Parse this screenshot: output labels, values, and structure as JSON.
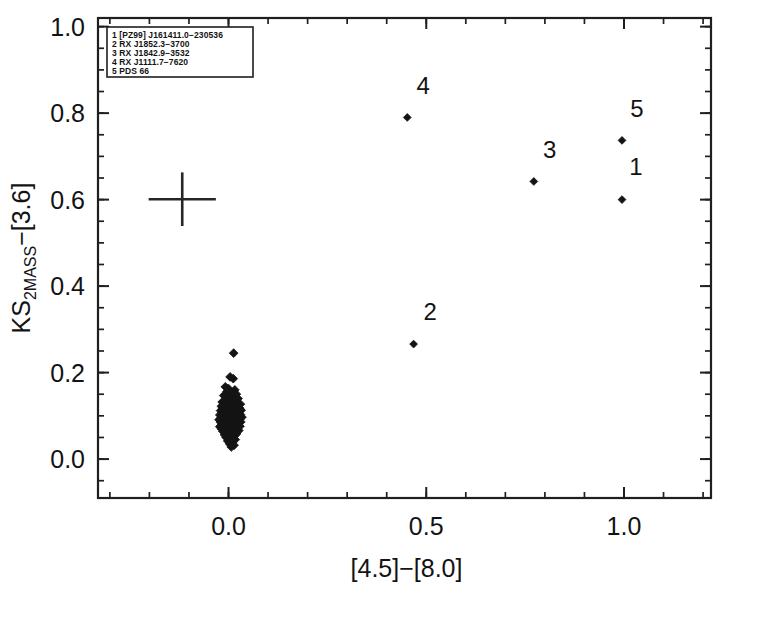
{
  "chart_data": {
    "type": "scatter",
    "title": "",
    "xlabel": "[4.5]−[8.0]",
    "ylabel": "KS_2MASS−[3.6]",
    "ylabel_main": "KS",
    "ylabel_sub": "2MASS",
    "ylabel_rest": "−[3.6]",
    "xlim": [
      -0.33,
      1.22
    ],
    "ylim": [
      -0.09,
      1.02
    ],
    "xticks": [
      0.0,
      0.5,
      1.0
    ],
    "xticklabels": [
      "0.0",
      "0.5",
      "1.0"
    ],
    "yticks": [
      0.0,
      0.2,
      0.4,
      0.6,
      0.8,
      1.0
    ],
    "yticklabels": [
      "0.0",
      "0.2",
      "0.4",
      "0.6",
      "0.8",
      "1.0"
    ],
    "minor_tick_interval_x": 0.1,
    "minor_tick_interval_y": 0.05,
    "grid": false,
    "legend_position": "top-left",
    "marker": "diamond",
    "labeled_points": [
      {
        "id": "1",
        "x": 0.995,
        "y": 0.6,
        "label_dx": 0.035,
        "label_dy": 0.075
      },
      {
        "id": "2",
        "x": 0.468,
        "y": 0.266,
        "label_dx": 0.042,
        "label_dy": 0.073
      },
      {
        "id": "3",
        "x": 0.772,
        "y": 0.642,
        "label_dx": 0.04,
        "label_dy": 0.072
      },
      {
        "id": "4",
        "x": 0.452,
        "y": 0.79,
        "label_dx": 0.04,
        "label_dy": 0.072
      },
      {
        "id": "5",
        "x": 0.995,
        "y": 0.737,
        "label_dx": 0.038,
        "label_dy": 0.072
      }
    ],
    "error_bar": {
      "x": -0.117,
      "y": 0.601,
      "xerr": 0.085,
      "yerr": 0.062
    },
    "cluster_points": [
      {
        "x": 0.013,
        "y": 0.245
      },
      {
        "x": 0.004,
        "y": 0.19
      },
      {
        "x": 0.012,
        "y": 0.186
      },
      {
        "x": -0.008,
        "y": 0.167
      },
      {
        "x": 0.0,
        "y": 0.163
      },
      {
        "x": 0.016,
        "y": 0.16
      },
      {
        "x": -0.004,
        "y": 0.156
      },
      {
        "x": 0.008,
        "y": 0.152
      },
      {
        "x": 0.02,
        "y": 0.15
      },
      {
        "x": -0.012,
        "y": 0.147
      },
      {
        "x": 0.002,
        "y": 0.144
      },
      {
        "x": 0.014,
        "y": 0.142
      },
      {
        "x": 0.024,
        "y": 0.14
      },
      {
        "x": -0.006,
        "y": 0.138
      },
      {
        "x": 0.006,
        "y": 0.136
      },
      {
        "x": 0.018,
        "y": 0.134
      },
      {
        "x": -0.016,
        "y": 0.132
      },
      {
        "x": -0.002,
        "y": 0.13
      },
      {
        "x": 0.01,
        "y": 0.129
      },
      {
        "x": 0.022,
        "y": 0.128
      },
      {
        "x": 0.03,
        "y": 0.127
      },
      {
        "x": -0.01,
        "y": 0.126
      },
      {
        "x": 0.0,
        "y": 0.125
      },
      {
        "x": 0.012,
        "y": 0.124
      },
      {
        "x": 0.024,
        "y": 0.123
      },
      {
        "x": -0.018,
        "y": 0.122
      },
      {
        "x": -0.006,
        "y": 0.121
      },
      {
        "x": 0.004,
        "y": 0.12
      },
      {
        "x": 0.016,
        "y": 0.119
      },
      {
        "x": 0.028,
        "y": 0.118
      },
      {
        "x": -0.014,
        "y": 0.117
      },
      {
        "x": -0.002,
        "y": 0.116
      },
      {
        "x": 0.008,
        "y": 0.115
      },
      {
        "x": 0.02,
        "y": 0.114
      },
      {
        "x": 0.032,
        "y": 0.113
      },
      {
        "x": -0.02,
        "y": 0.112
      },
      {
        "x": -0.008,
        "y": 0.111
      },
      {
        "x": 0.002,
        "y": 0.11
      },
      {
        "x": 0.014,
        "y": 0.109
      },
      {
        "x": 0.026,
        "y": 0.108
      },
      {
        "x": -0.016,
        "y": 0.107
      },
      {
        "x": -0.004,
        "y": 0.106
      },
      {
        "x": 0.006,
        "y": 0.105
      },
      {
        "x": 0.018,
        "y": 0.104
      },
      {
        "x": 0.03,
        "y": 0.103
      },
      {
        "x": -0.022,
        "y": 0.102
      },
      {
        "x": -0.01,
        "y": 0.101
      },
      {
        "x": 0.0,
        "y": 0.1
      },
      {
        "x": 0.01,
        "y": 0.099
      },
      {
        "x": 0.022,
        "y": 0.098
      },
      {
        "x": 0.034,
        "y": 0.097
      },
      {
        "x": -0.018,
        "y": 0.096
      },
      {
        "x": -0.006,
        "y": 0.095
      },
      {
        "x": 0.004,
        "y": 0.094
      },
      {
        "x": 0.016,
        "y": 0.093
      },
      {
        "x": 0.028,
        "y": 0.092
      },
      {
        "x": -0.024,
        "y": 0.091
      },
      {
        "x": -0.012,
        "y": 0.09
      },
      {
        "x": -0.002,
        "y": 0.089
      },
      {
        "x": 0.008,
        "y": 0.088
      },
      {
        "x": 0.02,
        "y": 0.087
      },
      {
        "x": 0.031,
        "y": 0.086
      },
      {
        "x": -0.02,
        "y": 0.085
      },
      {
        "x": -0.008,
        "y": 0.084
      },
      {
        "x": 0.002,
        "y": 0.083
      },
      {
        "x": 0.012,
        "y": 0.082
      },
      {
        "x": 0.024,
        "y": 0.081
      },
      {
        "x": -0.016,
        "y": 0.08
      },
      {
        "x": -0.004,
        "y": 0.079
      },
      {
        "x": 0.006,
        "y": 0.078
      },
      {
        "x": 0.018,
        "y": 0.077
      },
      {
        "x": 0.029,
        "y": 0.076
      },
      {
        "x": -0.022,
        "y": 0.075
      },
      {
        "x": -0.01,
        "y": 0.074
      },
      {
        "x": 0.0,
        "y": 0.073
      },
      {
        "x": 0.01,
        "y": 0.072
      },
      {
        "x": 0.021,
        "y": 0.071
      },
      {
        "x": -0.018,
        "y": 0.07
      },
      {
        "x": -0.006,
        "y": 0.069
      },
      {
        "x": 0.004,
        "y": 0.068
      },
      {
        "x": 0.015,
        "y": 0.067
      },
      {
        "x": 0.026,
        "y": 0.066
      },
      {
        "x": -0.014,
        "y": 0.064
      },
      {
        "x": -0.002,
        "y": 0.062
      },
      {
        "x": 0.009,
        "y": 0.06
      },
      {
        "x": 0.02,
        "y": 0.058
      },
      {
        "x": -0.01,
        "y": 0.056
      },
      {
        "x": 0.001,
        "y": 0.054
      },
      {
        "x": 0.013,
        "y": 0.052
      },
      {
        "x": -0.006,
        "y": 0.05
      },
      {
        "x": 0.006,
        "y": 0.047
      },
      {
        "x": 0.017,
        "y": 0.045
      },
      {
        "x": -0.002,
        "y": 0.042
      },
      {
        "x": 0.01,
        "y": 0.039
      },
      {
        "x": 0.003,
        "y": 0.035
      },
      {
        "x": 0.014,
        "y": 0.032
      },
      {
        "x": 0.007,
        "y": 0.028
      }
    ]
  },
  "legend": {
    "entries": [
      {
        "id": "1",
        "name": "[PZ99] J161411.0−230536"
      },
      {
        "id": "2",
        "name": "RX J1852.3−3700"
      },
      {
        "id": "3",
        "name": "RX J1842.9−3532"
      },
      {
        "id": "4",
        "name": "RX J1111.7−7620"
      },
      {
        "id": "5",
        "name": "PDS 66"
      }
    ]
  }
}
